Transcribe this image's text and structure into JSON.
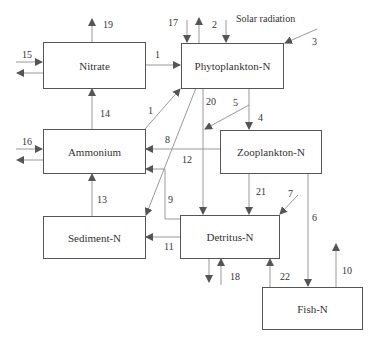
{
  "diagram": {
    "title": "",
    "boxes": {
      "nitrate": "Nitrate",
      "phytoplankton": "Phytoplankton-N",
      "ammonium": "Ammonium",
      "zooplankton": "Zooplankton-N",
      "sediment": "Sediment-N",
      "detritus": "Detritus-N",
      "fish": "Fish-N"
    },
    "annotations": {
      "solar": "Solar radiation"
    },
    "flows": {
      "f1a": "1",
      "f1b": "1",
      "f2": "2",
      "f3": "3",
      "f4": "4",
      "f5": "5",
      "f6": "6",
      "f7": "7",
      "f8": "8",
      "f9": "9",
      "f10": "10",
      "f11": "11",
      "f12": "12",
      "f13": "13",
      "f14": "14",
      "f15": "15",
      "f16": "16",
      "f17": "17",
      "f18": "18",
      "f19": "19",
      "f20": "20",
      "f21": "21",
      "f22": "22"
    },
    "colors": {
      "line": "#999999",
      "arrow": "#555555",
      "border": "#555555"
    }
  }
}
